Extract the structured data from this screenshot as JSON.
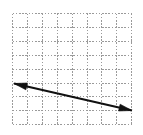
{
  "figure": {
    "title": "Line with negative slope drawn on graph paper",
    "background_color": "#ffffff",
    "width": 143,
    "height": 135
  },
  "grid": {
    "name": "graph-paper-grid",
    "columns": 8,
    "rows": 8,
    "cell_width": 14.9,
    "cell_height": 13.9,
    "left": 12,
    "top": 13,
    "right": 131.2,
    "bottom": 124.2,
    "line_color": "#9a9a9a",
    "line_width": 1,
    "dash_pattern": "1.6 1.6",
    "style": "dashed"
  },
  "arrow": {
    "name": "double-headed-arrow",
    "color": "#111111",
    "line_width": 2.2,
    "start_x": 14,
    "start_y": 83.5,
    "end_x": 132,
    "end_y": 110.5,
    "slope": -0.229,
    "heads": "both",
    "head_length": 13,
    "head_width": 7,
    "left_head_label": "arrowhead-left",
    "right_head_label": "arrowhead-right"
  },
  "chart_data": {
    "type": "line",
    "title": "",
    "xlabel": "",
    "ylabel": "",
    "grid": true,
    "legend": false,
    "xlim": [
      0,
      8
    ],
    "ylim": [
      0,
      8
    ],
    "xticks": [
      0,
      1,
      2,
      3,
      4,
      5,
      6,
      7,
      8
    ],
    "yticks": [
      0,
      1,
      2,
      3,
      4,
      5,
      6,
      7,
      8
    ],
    "series": [
      {
        "name": "line",
        "x": [
          0.13,
          8.05
        ],
        "y": [
          2.93,
          1.0
        ],
        "style": "double-arrow",
        "color": "#111111"
      }
    ]
  }
}
